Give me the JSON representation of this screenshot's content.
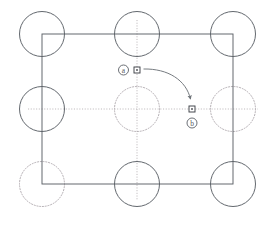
{
  "figure": {
    "title": "",
    "type": "lattice-displacement-diagram",
    "width": 273,
    "height": 225,
    "background": "#ffffff"
  },
  "colors": {
    "solid_stroke": "#5b6066",
    "dotted_stroke": "#a9a2a8",
    "rect_stroke": "#5b6066",
    "axis_dotted": "#b8b2b6",
    "marker_stroke": "#3d4147",
    "arrow_stroke": "#6f7479",
    "label_text": "#555a5e"
  },
  "geometry": {
    "circle_radius": 22.5,
    "columns_x": [
      42,
      137,
      233
    ],
    "rows_y": [
      34,
      109,
      184
    ],
    "rect": {
      "x": 42,
      "y": 34,
      "width": 191,
      "height": 150
    }
  },
  "circles": [
    {
      "id": "circle-top-left",
      "cx": 42,
      "cy": 34,
      "r": 22.5,
      "style": "solid"
    },
    {
      "id": "circle-top-center",
      "cx": 137,
      "cy": 34,
      "r": 22.5,
      "style": "solid"
    },
    {
      "id": "circle-top-right",
      "cx": 233,
      "cy": 34,
      "r": 22.5,
      "style": "solid"
    },
    {
      "id": "circle-middle-left",
      "cx": 42,
      "cy": 109,
      "r": 22.5,
      "style": "solid"
    },
    {
      "id": "circle-middle-center",
      "cx": 137,
      "cy": 109,
      "r": 22.5,
      "style": "dotted"
    },
    {
      "id": "circle-middle-right",
      "cx": 233,
      "cy": 109,
      "r": 22.5,
      "style": "dotted"
    },
    {
      "id": "circle-bottom-left",
      "cx": 42,
      "cy": 184,
      "r": 22.5,
      "style": "dotted"
    },
    {
      "id": "circle-bottom-center",
      "cx": 137,
      "cy": 184,
      "r": 22.5,
      "style": "solid"
    },
    {
      "id": "circle-bottom-right",
      "cx": 233,
      "cy": 184,
      "r": 22.5,
      "style": "solid"
    }
  ],
  "guide_lines": [
    {
      "id": "horizontal-center-guide",
      "x1": 28,
      "y1": 109,
      "x2": 258,
      "y2": 109,
      "style": "dotted"
    },
    {
      "id": "vertical-center-guide",
      "x1": 137,
      "y1": 20,
      "x2": 137,
      "y2": 200,
      "style": "dotted"
    }
  ],
  "markers": [
    {
      "id": "marker-a",
      "label": "a",
      "x": 137,
      "y": 70,
      "size": 6,
      "label_x": 124,
      "label_y": 70
    },
    {
      "id": "marker-b",
      "label": "b",
      "x": 192,
      "y": 109,
      "size": 6,
      "label_x": 192,
      "label_y": 123
    }
  ],
  "arrow": {
    "id": "displacement-arrow",
    "from": {
      "x": 143,
      "y": 69
    },
    "to": {
      "x": 190,
      "y": 100
    },
    "control": {
      "x": 180,
      "y": 70
    },
    "head_size": 4
  },
  "labels": {
    "a": "a",
    "b": "b"
  }
}
